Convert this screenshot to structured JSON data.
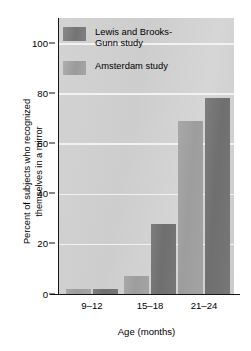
{
  "chart_data": {
    "type": "bar",
    "title": "",
    "xlabel": "Age (months)",
    "ylabel": "Percent of subjects who recognized\nthemselves in a mirror",
    "categories": [
      "9–12",
      "15–18",
      "21–24"
    ],
    "series": [
      {
        "name": "Lewis and Brooks-\nGunn study",
        "color": "#747474",
        "values": [
          2,
          28,
          78
        ]
      },
      {
        "name": "Amsterdam study",
        "color": "#9d9d9d",
        "values": [
          2,
          7,
          69
        ]
      }
    ],
    "ylim": [
      0,
      110
    ],
    "yticks": [
      0,
      20,
      40,
      60,
      80,
      100
    ],
    "ytick_labels": [
      "0",
      "20",
      "40",
      "60",
      "80",
      "100"
    ],
    "gridlines": [
      20,
      40,
      60,
      80,
      100
    ],
    "grid": true,
    "legend_position": "upper-left-inside",
    "plot_background": "#d1d1d1",
    "gridline_color": "#f2f2f2",
    "axis_color": "#151515"
  },
  "legend": {
    "items": [
      {
        "label": "Lewis and Brooks-\nGunn study",
        "swatch": "dark"
      },
      {
        "label": "Amsterdam study",
        "swatch": "light"
      }
    ]
  }
}
